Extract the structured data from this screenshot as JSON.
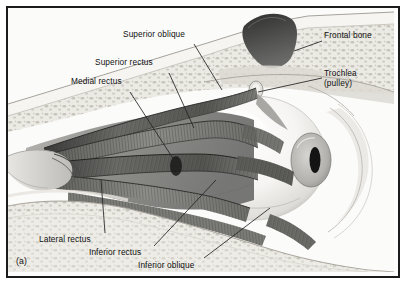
{
  "figure": {
    "label": "(a)",
    "caption_present": false,
    "view": "lateral cutaway of the right orbit showing extraocular muscles",
    "style": "grayscale halftone anatomical illustration",
    "border_color": "#1b1b1b",
    "background_color": "#fdfdfd"
  },
  "labels": [
    {
      "id": "superior-oblique",
      "text": "Superior oblique",
      "x": 121,
      "y": 27,
      "leader": "from label down-right to the superior oblique muscle belly"
    },
    {
      "id": "superior-rectus",
      "text": "Superior rectus",
      "x": 93,
      "y": 55,
      "leader": "from label down-right to the superior rectus muscle"
    },
    {
      "id": "medial-rectus",
      "text": "Medial rectus",
      "x": 69,
      "y": 74,
      "leader": "from label down-right to the medial rectus muscle"
    },
    {
      "id": "frontal-bone",
      "text": "Frontal bone",
      "x": 322,
      "y": 28,
      "leader": "from label left to the cancellous frontal bone with sinus"
    },
    {
      "id": "trochlea",
      "text": "Trochlea",
      "text2": "(pulley)",
      "x": 322,
      "y": 66,
      "leader": "from label left to the trochlea at the superomedial orbit"
    },
    {
      "id": "lateral-rectus",
      "text": "Lateral rectus",
      "x": 37,
      "y": 232,
      "leader": "from label up-right to the lateral rectus muscle"
    },
    {
      "id": "inferior-rectus",
      "text": "Inferior rectus",
      "x": 87,
      "y": 245,
      "leader": "from label up-right to the inferior rectus muscle"
    },
    {
      "id": "inferior-oblique",
      "text": "Inferior oblique",
      "x": 136,
      "y": 258,
      "leader": "from label up-right to the inferior oblique muscle"
    }
  ],
  "anatomy": {
    "eyeball": {
      "name": "eyeball (globe)",
      "sclera_tone": "#f4f4f2",
      "cornea_tone": "#b9b9b7",
      "pupil_tone": "#151515"
    },
    "orbital_bone": {
      "name": "orbital bone (cancellous)",
      "tone": "#e9e7e2"
    },
    "sinus": {
      "name": "frontal sinus cavity",
      "tone": "#4a4a4a"
    },
    "orbital_fat": {
      "name": "orbital fat / connective tissue",
      "tone": "#8d8d8b"
    },
    "optic_nerve": {
      "name": "optic nerve at orbital apex",
      "tone": "#cfcfcc"
    }
  },
  "palette": {
    "ink": "#101010",
    "leader_line": "#2a2a2a",
    "light": "#f2f1ee",
    "mid": "#9a9a97",
    "dark": "#3a3a38"
  }
}
